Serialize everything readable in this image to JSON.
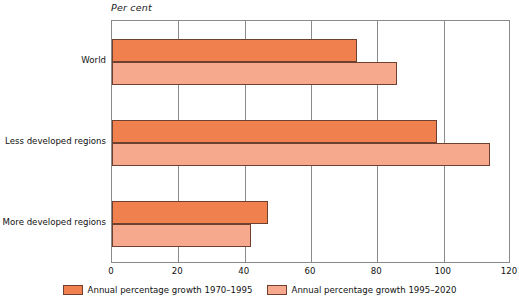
{
  "chart_data": {
    "type": "bar",
    "orientation": "horizontal",
    "title": "Per cent",
    "xlabel": "",
    "ylabel": "",
    "xlim": [
      0,
      120
    ],
    "xticks": [
      0,
      20,
      40,
      60,
      80,
      100,
      120
    ],
    "xtick_labels": [
      "0",
      "20",
      "40",
      "60",
      "80",
      "100",
      "120"
    ],
    "grid": true,
    "grid_axis": "x",
    "legend_position": "bottom-center",
    "categories": [
      "World",
      "Less developed regions",
      "More developed regions"
    ],
    "series": [
      {
        "name": "Annual percentage growth 1970–1995",
        "color": "#f0814e",
        "values": [
          74,
          98,
          47
        ]
      },
      {
        "name": "Annual percentage growth 1995–2020",
        "color": "#f6a98d",
        "values": [
          86,
          114,
          42
        ]
      }
    ]
  },
  "colors": {
    "series_dark": "#f0814e",
    "series_light": "#f6a98d",
    "bar_outline": "#6e4030",
    "axis": "#8a8a8a",
    "background": "#ffffff"
  }
}
